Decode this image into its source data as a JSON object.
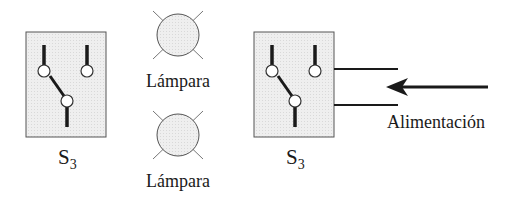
{
  "switches": [
    {
      "label": "S",
      "subscript": "3"
    },
    {
      "label": "S",
      "subscript": "3"
    }
  ],
  "lamps": [
    {
      "label": "Lámpara"
    },
    {
      "label": "Lámpara"
    }
  ],
  "supply": {
    "label": "Alimentación"
  },
  "colors": {
    "box_fill": "#ececec",
    "lamp_fill": "#e6e6e6",
    "stroke": "#1a1a1a",
    "ray": "#777777"
  }
}
